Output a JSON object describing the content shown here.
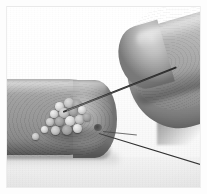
{
  "image": {
    "title": "Macro photograph of a fingertip with small pale granules and a threaded needle",
    "medium": "grayscale photograph",
    "width_px": 207,
    "height_px": 194,
    "border": {
      "style": "thin light mat border",
      "color": "#ececec",
      "inset_px": 7
    },
    "background": {
      "description": "plain white paper backdrop with faint vertical texture",
      "color": "#fbfbfb",
      "shadow_color": "#f1f1f0"
    }
  },
  "subjects": [
    {
      "name": "left-fingertip",
      "label": "Fingertip holding granules",
      "position": "lower-left, rounded tip pointing right",
      "skin_tone": "#9d9b98"
    },
    {
      "name": "right-fingertip",
      "label": "Second fingertip holding the needle",
      "position": "upper-right, pointing down-left",
      "skin_tone": "#adaba7"
    },
    {
      "name": "granule-cluster",
      "label": "Cluster of small pale granules",
      "count": 17,
      "color": "#ddd9d3"
    },
    {
      "name": "needle",
      "label": "Thin dark needle",
      "color": "#1e1e1d"
    },
    {
      "name": "thread",
      "label": "Thin thread trailing to lower right",
      "color": "#2f2e2c"
    }
  ],
  "granules": [
    {
      "x": 48,
      "y": 95,
      "d": 9
    },
    {
      "x": 57,
      "y": 91,
      "d": 10
    },
    {
      "x": 66,
      "y": 93,
      "d": 9
    },
    {
      "x": 43,
      "y": 103,
      "d": 8
    },
    {
      "x": 52,
      "y": 101,
      "d": 10
    },
    {
      "x": 62,
      "y": 100,
      "d": 9
    },
    {
      "x": 71,
      "y": 99,
      "d": 8
    },
    {
      "x": 39,
      "y": 111,
      "d": 8
    },
    {
      "x": 48,
      "y": 110,
      "d": 9
    },
    {
      "x": 58,
      "y": 109,
      "d": 10
    },
    {
      "x": 68,
      "y": 108,
      "d": 9
    },
    {
      "x": 76,
      "y": 106,
      "d": 8
    },
    {
      "x": 34,
      "y": 119,
      "d": 7
    },
    {
      "x": 44,
      "y": 119,
      "d": 9
    },
    {
      "x": 55,
      "y": 118,
      "d": 10
    },
    {
      "x": 66,
      "y": 117,
      "d": 9
    },
    {
      "x": 25,
      "y": 126,
      "d": 7
    }
  ]
}
